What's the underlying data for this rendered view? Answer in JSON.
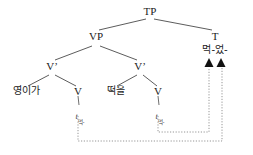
{
  "diagram": {
    "type": "syntactic-tree",
    "language": "Korean",
    "title": "",
    "colors": {
      "branch": "#4a4a4a",
      "text": "#1a1a1a",
      "movement": "#777777",
      "background": "#ffffff"
    },
    "nodes": {
      "tp": {
        "label": "TP",
        "x": 150,
        "y": 8
      },
      "vp": {
        "label": "VP",
        "x": 96,
        "y": 35
      },
      "t": {
        "label": "T",
        "x": 215,
        "y": 35
      },
      "t_head": {
        "label": "먹-었-",
        "x": 215,
        "y": 50
      },
      "vbar_left": {
        "label": "V’",
        "x": 52,
        "y": 65
      },
      "vbar_right": {
        "label": "V’",
        "x": 140,
        "y": 65
      },
      "subject": {
        "label": "영이가",
        "x": 26,
        "y": 91
      },
      "v_left": {
        "label": "V",
        "x": 78,
        "y": 90
      },
      "object": {
        "label": "떡을",
        "x": 116,
        "y": 91
      },
      "v_right": {
        "label": "V",
        "x": 158,
        "y": 90
      }
    },
    "traces": [
      {
        "mark": "t",
        "subscript": "먹-",
        "x": 80,
        "y": 110
      },
      {
        "mark": "t",
        "subscript": "먹-",
        "x": 160,
        "y": 110
      }
    ],
    "arrowheads": [
      {
        "x": 208,
        "y": 62
      },
      {
        "x": 221,
        "y": 62
      }
    ]
  }
}
